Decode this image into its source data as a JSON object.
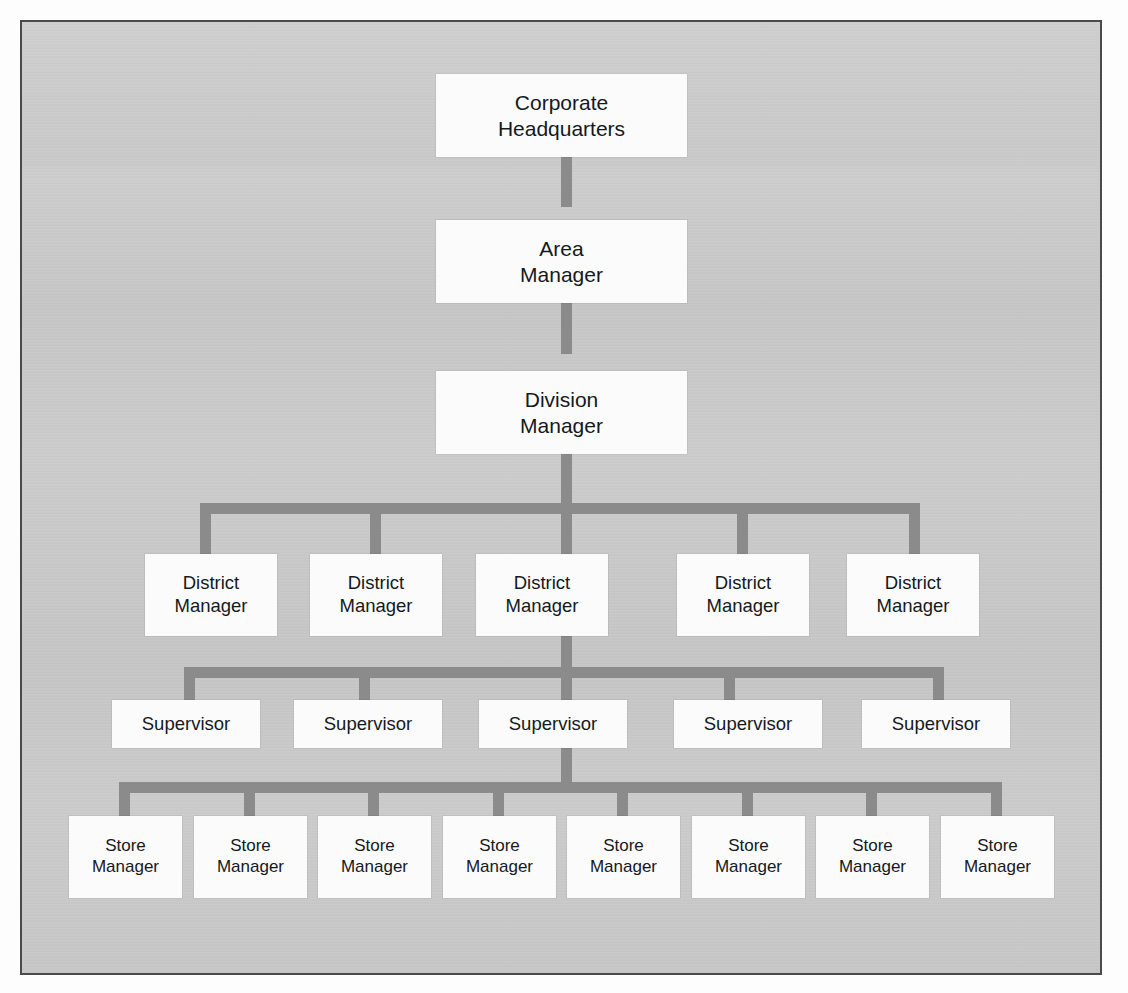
{
  "chart": {
    "type": "org-chart",
    "background_color": "#c9c9c9",
    "node_color": "#fbfbfb",
    "connector_color": "#8b8b8b",
    "border_color": "#4a4a4a",
    "levels": [
      {
        "level": 1,
        "label": "Corporate Headquarters",
        "count": 1,
        "nodes": [
          {
            "line1": "Corporate",
            "line2": "Headquarters",
            "x": 434,
            "y": 72,
            "w": 251,
            "h": 83
          }
        ]
      },
      {
        "level": 2,
        "label": "Area Manager",
        "count": 1,
        "nodes": [
          {
            "line1": "Area",
            "line2": "Manager",
            "x": 434,
            "y": 218,
            "w": 251,
            "h": 83
          }
        ]
      },
      {
        "level": 3,
        "label": "Division Manager",
        "count": 1,
        "nodes": [
          {
            "line1": "Division",
            "line2": "Manager",
            "x": 434,
            "y": 369,
            "w": 251,
            "h": 83
          }
        ]
      },
      {
        "level": 4,
        "label": "District Manager",
        "count": 5,
        "nodes": [
          {
            "line1": "District",
            "line2": "Manager",
            "x": 143,
            "y": 552,
            "w": 132,
            "h": 82
          },
          {
            "line1": "District",
            "line2": "Manager",
            "x": 308,
            "y": 552,
            "w": 132,
            "h": 82
          },
          {
            "line1": "District",
            "line2": "Manager",
            "x": 474,
            "y": 552,
            "w": 132,
            "h": 82
          },
          {
            "line1": "District",
            "line2": "Manager",
            "x": 675,
            "y": 552,
            "w": 132,
            "h": 82
          },
          {
            "line1": "District",
            "line2": "Manager",
            "x": 845,
            "y": 552,
            "w": 132,
            "h": 82
          }
        ]
      },
      {
        "level": 5,
        "label": "Supervisor",
        "count": 5,
        "nodes": [
          {
            "line1": "Supervisor",
            "line2": "",
            "x": 110,
            "y": 698,
            "w": 148,
            "h": 48
          },
          {
            "line1": "Supervisor",
            "line2": "",
            "x": 292,
            "y": 698,
            "w": 148,
            "h": 48
          },
          {
            "line1": "Supervisor",
            "line2": "",
            "x": 477,
            "y": 698,
            "w": 148,
            "h": 48
          },
          {
            "line1": "Supervisor",
            "line2": "",
            "x": 672,
            "y": 698,
            "w": 148,
            "h": 48
          },
          {
            "line1": "Supervisor",
            "line2": "",
            "x": 860,
            "y": 698,
            "w": 148,
            "h": 48
          }
        ]
      },
      {
        "level": 6,
        "label": "Store Manager",
        "count": 8,
        "nodes": [
          {
            "line1": "Store",
            "line2": "Manager",
            "x": 67,
            "y": 814,
            "w": 113,
            "h": 82
          },
          {
            "line1": "Store",
            "line2": "Manager",
            "x": 192,
            "y": 814,
            "w": 113,
            "h": 82
          },
          {
            "line1": "Store",
            "line2": "Manager",
            "x": 316,
            "y": 814,
            "w": 113,
            "h": 82
          },
          {
            "line1": "Store",
            "line2": "Manager",
            "x": 441,
            "y": 814,
            "w": 113,
            "h": 82
          },
          {
            "line1": "Store",
            "line2": "Manager",
            "x": 565,
            "y": 814,
            "w": 113,
            "h": 82
          },
          {
            "line1": "Store",
            "line2": "Manager",
            "x": 690,
            "y": 814,
            "w": 113,
            "h": 82
          },
          {
            "line1": "Store",
            "line2": "Manager",
            "x": 814,
            "y": 814,
            "w": 113,
            "h": 82
          },
          {
            "line1": "Store",
            "line2": "Manager",
            "x": 939,
            "y": 814,
            "w": 113,
            "h": 82
          }
        ]
      }
    ],
    "connectors": {
      "spine_x": 564,
      "bar_thickness": 11,
      "district_bar": {
        "x": 198,
        "y": 501,
        "w": 720
      },
      "supervisor_bar": {
        "x": 182,
        "y": 665,
        "w": 760
      },
      "store_bar": {
        "x": 117,
        "y": 780,
        "w": 883
      }
    }
  }
}
